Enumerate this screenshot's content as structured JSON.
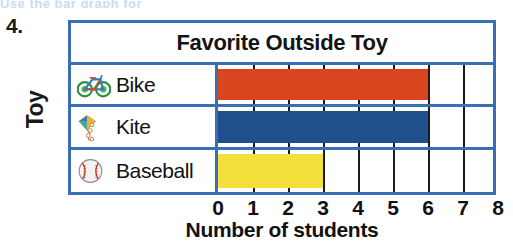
{
  "worksheet": {
    "problem_number": "4.",
    "scan_bleed_text": "Use the bar graph for"
  },
  "chart_title": "Favorite Outside Toy",
  "axis_y_label": "Toy",
  "axis_x_label": "Number of students",
  "x_ticks": [
    "0",
    "1",
    "2",
    "3",
    "4",
    "5",
    "6",
    "7",
    "8"
  ],
  "rows": [
    {
      "label": "Bike",
      "icon": "bicycle-icon",
      "value": 6,
      "color": "#d9451f"
    },
    {
      "label": "Kite",
      "icon": "kite-icon",
      "value": 6,
      "color": "#204f8d"
    },
    {
      "label": "Baseball",
      "icon": "baseball-icon",
      "value": 3,
      "color": "#f3e03a"
    }
  ],
  "colors": {
    "frame_blue": "#3a6fb5",
    "bar_red": "#d9451f",
    "bar_blue": "#204f8d",
    "bar_yellow": "#f3e03a",
    "gridline": "#1b1b1b",
    "background": "#ffffff"
  },
  "chart_data": {
    "type": "bar",
    "orientation": "horizontal",
    "title": "Favorite Outside Toy",
    "xlabel": "Number of students",
    "ylabel": "Toy",
    "categories": [
      "Bike",
      "Kite",
      "Baseball"
    ],
    "values": [
      6,
      6,
      3
    ],
    "xlim": [
      0,
      8
    ],
    "xticks": [
      0,
      1,
      2,
      3,
      4,
      5,
      6,
      7,
      8
    ],
    "grid": true,
    "legend": false,
    "series_colors": [
      "#d9451f",
      "#204f8d",
      "#f3e03a"
    ]
  }
}
